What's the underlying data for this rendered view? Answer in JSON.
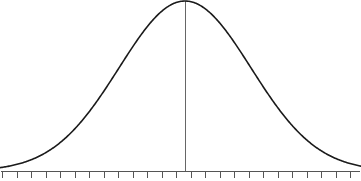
{
  "figure": {
    "width": 361,
    "height": 181,
    "background_color": "#ffffff",
    "title": "",
    "subtitle": ""
  },
  "style": {
    "curve_color": "#1a1a1a",
    "curve_width": 1.6,
    "axis_color": "#555555",
    "axis_width": 1,
    "tick_color": "#555555",
    "tick_width": 1,
    "tick_length": 7,
    "center_line_color": "#666666",
    "center_line_width": 1
  },
  "axis": {
    "baseline_y": 171,
    "x_start": 1,
    "x_end": 360,
    "tick_count": 25,
    "tick_spacing": 14.5,
    "tick_first_x": 2,
    "tick_labels": [],
    "ylabel": "",
    "xlabel": "",
    "grid": false
  },
  "center_line": {
    "x": 185,
    "y_top": 1,
    "y_bottom": 171,
    "label": ""
  },
  "chart_data": {
    "type": "line",
    "xlabel": "",
    "ylabel": "",
    "grid": false,
    "legend": [],
    "annotations": [],
    "distribution": {
      "name": "normal",
      "mean_px": 185,
      "sigma_px": 66,
      "peak_x_px": 185,
      "peak_y_px": 1,
      "baseline_y_px": 171,
      "amplitude_px": 170
    },
    "axis_ranges": {
      "x_px": [
        0,
        361
      ],
      "y_px": [
        0,
        181
      ],
      "x_sigma_units": [
        -2.8,
        2.66
      ],
      "y_units": [
        0,
        1
      ]
    },
    "x": [
      0,
      10,
      20,
      30,
      40,
      50,
      60,
      70,
      80,
      90,
      100,
      110,
      120,
      130,
      140,
      150,
      160,
      170,
      180,
      185,
      190,
      200,
      210,
      220,
      230,
      240,
      250,
      260,
      270,
      280,
      290,
      300,
      310,
      320,
      330,
      340,
      350,
      360
    ],
    "values": [
      0.019,
      0.03,
      0.046,
      0.068,
      0.099,
      0.138,
      0.188,
      0.248,
      0.318,
      0.396,
      0.479,
      0.564,
      0.647,
      0.723,
      0.79,
      0.844,
      0.884,
      0.908,
      0.999,
      1.0,
      0.999,
      0.97,
      0.92,
      0.855,
      0.778,
      0.695,
      0.609,
      0.524,
      0.443,
      0.368,
      0.3,
      0.24,
      0.189,
      0.146,
      0.111,
      0.083,
      0.061,
      0.044
    ],
    "series": [
      {
        "name": "normal-pdf",
        "color": "#1a1a1a",
        "values": [
          0.019,
          0.03,
          0.046,
          0.068,
          0.099,
          0.138,
          0.188,
          0.248,
          0.318,
          0.396,
          0.479,
          0.564,
          0.647,
          0.723,
          0.79,
          0.844,
          0.884,
          0.908,
          0.999,
          1.0,
          0.999,
          0.97,
          0.92,
          0.855,
          0.778,
          0.695,
          0.609,
          0.524,
          0.443,
          0.368,
          0.3,
          0.24,
          0.189,
          0.146,
          0.111,
          0.083,
          0.061,
          0.044
        ]
      }
    ]
  }
}
